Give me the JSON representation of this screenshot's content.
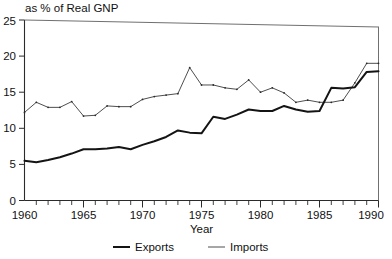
{
  "chart_data": {
    "type": "line",
    "title": "as % of Real GNP",
    "subtitle": "",
    "xlabel": "Year",
    "ylabel": "",
    "xlim": [
      1960,
      1990
    ],
    "ylim": [
      0,
      25
    ],
    "grid": false,
    "legend_position": "bottom-center",
    "y_ticks": [
      0,
      5,
      10,
      15,
      20,
      25
    ],
    "y_tick_labels": [
      "0",
      "5",
      "10",
      "15",
      "20",
      "25"
    ],
    "x_ticks": [
      1960,
      1965,
      1970,
      1975,
      1980,
      1985,
      1990
    ],
    "x_tick_labels": [
      "1960",
      "1965",
      "1970",
      "1975",
      "1980",
      "1985",
      "1990"
    ],
    "x_minor_tick_step": 1,
    "x": [
      1960,
      1961,
      1962,
      1963,
      1964,
      1965,
      1966,
      1967,
      1968,
      1969,
      1970,
      1971,
      1972,
      1973,
      1974,
      1975,
      1976,
      1977,
      1978,
      1979,
      1980,
      1981,
      1982,
      1983,
      1984,
      1985,
      1986,
      1987,
      1988,
      1989,
      1990
    ],
    "series": [
      {
        "name": "Exports",
        "style": "thick-solid",
        "color": "#141414",
        "values": [
          5.5,
          5.3,
          5.6,
          6.0,
          6.5,
          7.1,
          7.1,
          7.2,
          7.4,
          7.1,
          7.7,
          8.2,
          8.8,
          9.7,
          9.4,
          9.3,
          11.6,
          11.3,
          11.9,
          12.6,
          12.4,
          12.4,
          13.1,
          12.6,
          12.3,
          12.4,
          15.6,
          15.5,
          15.7,
          17.8,
          17.9
        ]
      },
      {
        "name": "Imports",
        "style": "thin-solid",
        "color": "#3a3a3a",
        "values": [
          12.2,
          13.6,
          12.9,
          12.9,
          13.7,
          11.7,
          11.8,
          13.1,
          13.0,
          13.0,
          14.0,
          14.4,
          14.6,
          14.8,
          18.4,
          16.0,
          16.0,
          15.6,
          15.4,
          16.7,
          15.0,
          15.6,
          14.9,
          13.6,
          13.9,
          13.6,
          13.6,
          13.9,
          16.3,
          19.0,
          19.0
        ]
      }
    ],
    "annotations": []
  },
  "legend": {
    "items": [
      {
        "label": "Exports"
      },
      {
        "label": "Imports"
      }
    ]
  },
  "axis": {
    "x_title": "Year"
  }
}
